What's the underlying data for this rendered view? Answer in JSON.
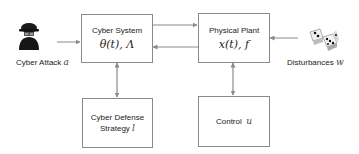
{
  "diagram": {
    "nodes": {
      "cyber_system": {
        "title": "Cyber System",
        "math": "θ(t), Λ"
      },
      "physical_plant": {
        "title": "Physical Plant",
        "math": "x(t), f"
      },
      "cyber_defense": {
        "title_line1": "Cyber Defense",
        "title_line2": "Strategy",
        "var": "l"
      },
      "control": {
        "title": "Control",
        "var": "u"
      }
    },
    "inputs": {
      "cyber_attack": {
        "label": "Cyber Attack",
        "var": "a",
        "icon": "hacker-icon"
      },
      "disturbances": {
        "label": "Disturbances",
        "var": "w",
        "icon": "dice-icon"
      }
    },
    "edges": [
      {
        "from": "cyber_attack",
        "to": "cyber_system",
        "type": "single-arrow"
      },
      {
        "from": "cyber_system",
        "to": "physical_plant",
        "type": "single-arrow"
      },
      {
        "from": "physical_plant",
        "to": "cyber_system",
        "type": "single-arrow"
      },
      {
        "from": "disturbances",
        "to": "physical_plant",
        "type": "single-arrow"
      },
      {
        "from": "cyber_system",
        "to": "cyber_defense",
        "type": "double-arrow"
      },
      {
        "from": "physical_plant",
        "to": "control",
        "type": "double-arrow"
      }
    ],
    "colors": {
      "line": "#8a8a8a",
      "border": "#8a8a8a"
    }
  }
}
